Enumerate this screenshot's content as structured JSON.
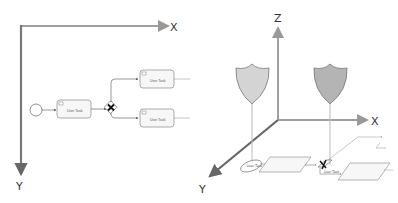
{
  "left_diagram": {
    "title": "2D BPMN coordinate system",
    "axes": {
      "x_label": "X",
      "y_label": "Y"
    },
    "nodes": [
      {
        "type": "start-event"
      },
      {
        "type": "user-task",
        "label": "User Task"
      },
      {
        "type": "exclusive-gateway",
        "symbol": "✕"
      },
      {
        "type": "user-task",
        "label": "User Task"
      },
      {
        "type": "user-task",
        "label": "User Task"
      }
    ]
  },
  "right_diagram": {
    "title": "3D BPMN coordinate system",
    "axes": {
      "x_label": "X",
      "y_label": "Y",
      "z_label": "Z"
    },
    "shields": [
      {
        "color": "#d4d4d4"
      },
      {
        "color": "#b4b4b4"
      }
    ],
    "nodes": [
      {
        "type": "start-event"
      },
      {
        "type": "user-task",
        "label": "User Task"
      },
      {
        "type": "exclusive-gateway",
        "symbol": "✕"
      },
      {
        "type": "user-task",
        "label": "User Task"
      },
      {
        "type": "user-task",
        "label": "User Task"
      }
    ]
  },
  "colors": {
    "axis": "#8c8c8c",
    "axis_dark": "#666666",
    "shape_stroke": "#666666",
    "task_fill": "#f7f7f7"
  }
}
